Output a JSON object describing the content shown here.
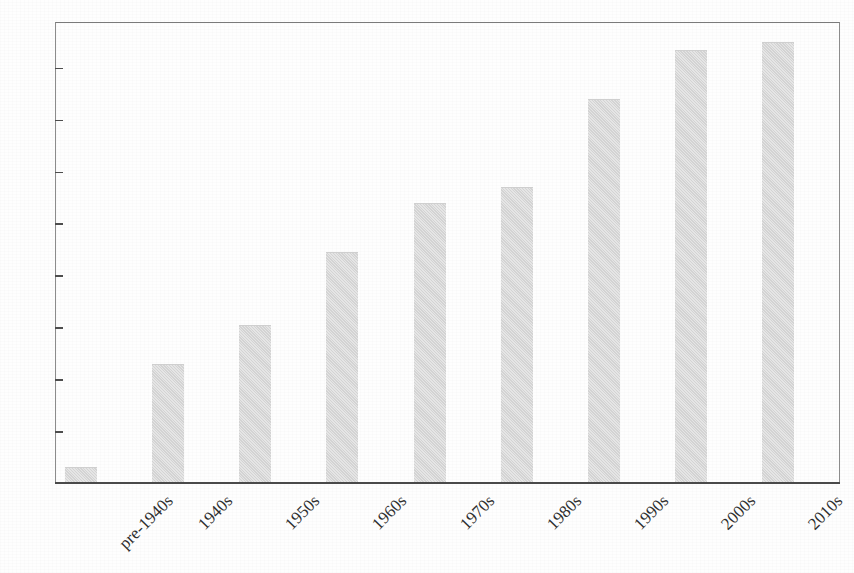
{
  "chart_data": {
    "type": "bar",
    "title": "",
    "xlabel": "",
    "ylabel": "",
    "categories": [
      "pre-1940s",
      "1940s",
      "1950s",
      "1960s",
      "1970s",
      "1980s",
      "1990s",
      "2000s",
      "2010s"
    ],
    "values": [
      3,
      23,
      30.5,
      44.5,
      54,
      57,
      74,
      83.5,
      85
    ],
    "ylim": [
      0,
      89
    ],
    "yticks": [
      10,
      20,
      30,
      40,
      50,
      60,
      70,
      80
    ],
    "ytick_labels": [
      "10",
      "20",
      "30",
      "40",
      "50",
      "60",
      "70",
      "80"
    ],
    "grid": false,
    "legend": null,
    "bar_color": "#dadada",
    "axis_color": "#4d4d4d",
    "x_label_rotation": -45
  }
}
